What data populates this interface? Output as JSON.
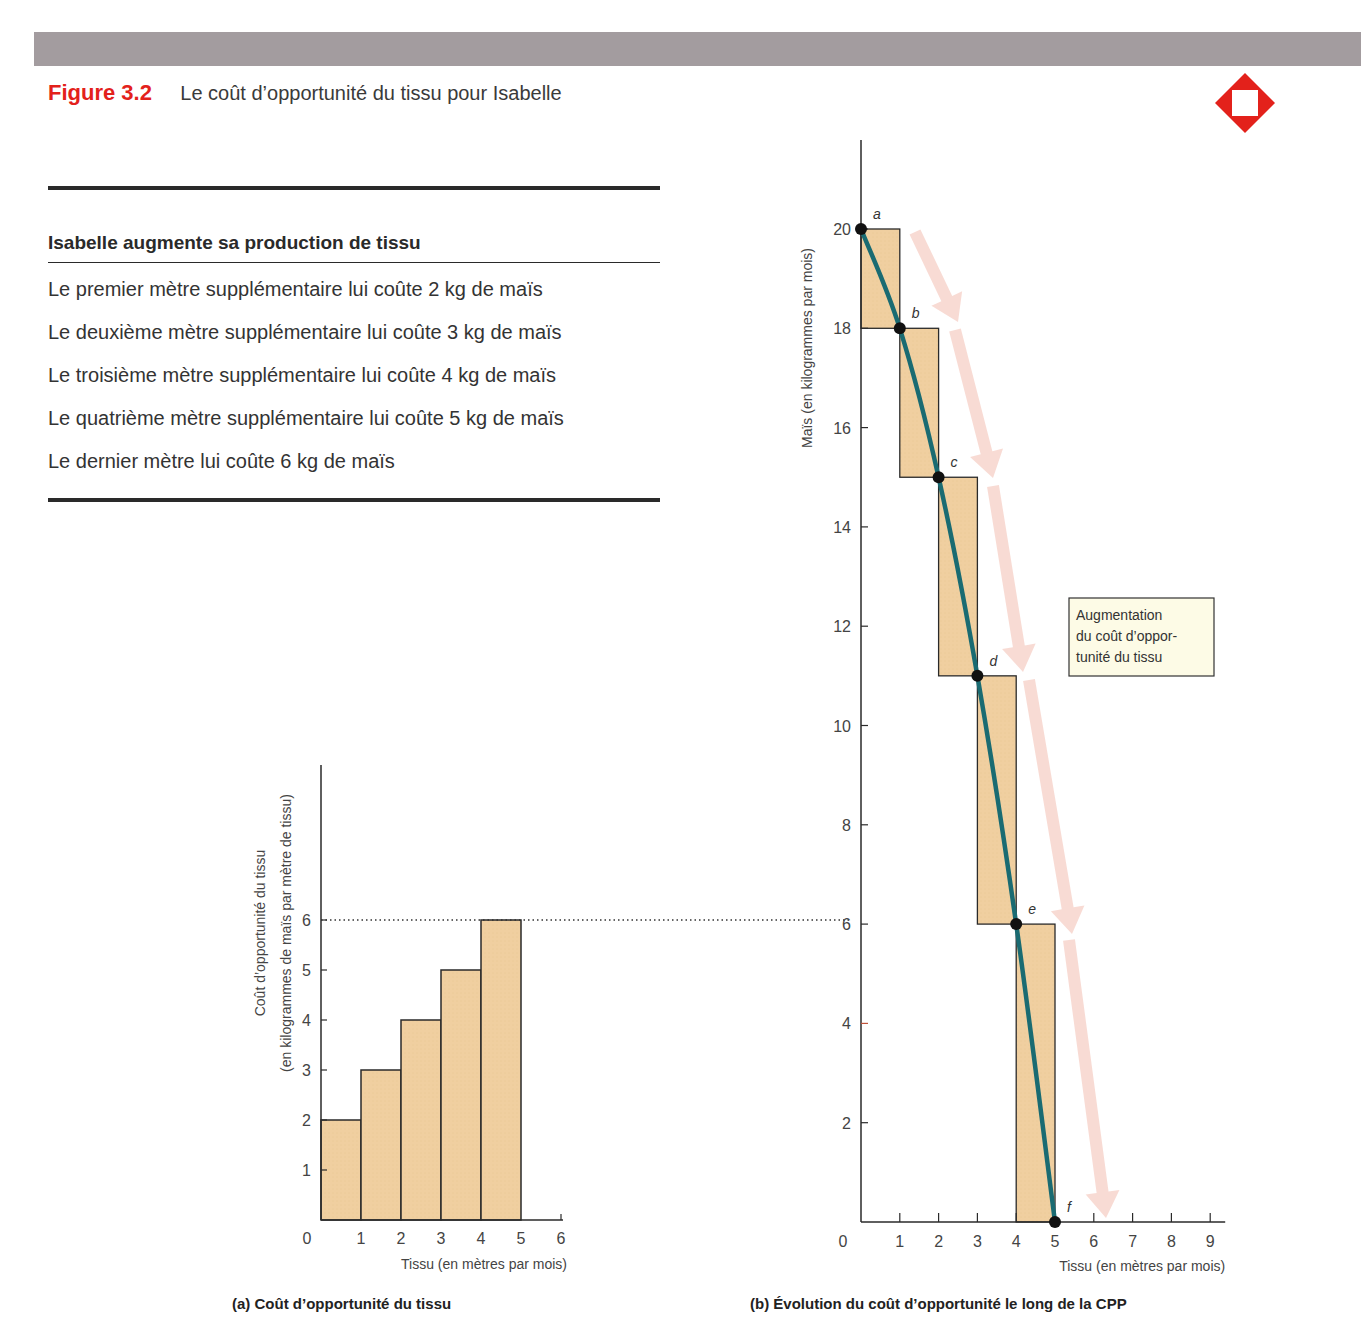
{
  "header": {
    "figure_number": "Figure 3.2",
    "figure_title": "Le coût d’opportunité du tissu pour Isabelle",
    "logo_icon": "red-diamond-logo-icon",
    "accent_color": "#e3211b",
    "bar_color": "#a39c9f"
  },
  "table": {
    "heading": "Isabelle augmente sa production de tissu",
    "rows": [
      "Le premier mètre supplémentaire lui coûte 2 kg de maïs",
      "Le deuxième mètre supplémentaire lui coûte 3 kg de maïs",
      "Le troisième mètre supplémentaire lui coûte 4 kg de maïs",
      "Le quatrième mètre supplémentaire lui coûte 5 kg de maïs",
      "Le dernier mètre lui coûte 6 kg de maïs"
    ]
  },
  "annotation": {
    "line1": "Augmentation",
    "line2": "du coût d’oppor-",
    "line3": "tunité du tissu"
  },
  "chart_data": [
    {
      "type": "bar",
      "title": "(a) Coût d’opportunité du tissu",
      "xlabel": "Tissu (en mètres par mois)",
      "ylabel": "Coût d’opportunité du tissu",
      "ylabel2": "(en kilogrammes de maïs par mètre de tissu)",
      "x_ticks": [
        "0",
        "1",
        "2",
        "3",
        "4",
        "5",
        "6"
      ],
      "y_ticks": [
        "1",
        "2",
        "3",
        "4",
        "5",
        "6"
      ],
      "categories": [
        "0–1",
        "1–2",
        "2–3",
        "3–4",
        "4–5"
      ],
      "values": [
        2,
        3,
        4,
        5,
        6
      ],
      "xlim": [
        0,
        6
      ],
      "ylim": [
        0,
        6
      ],
      "reference_line": {
        "y": 6,
        "style": "dotted"
      },
      "bar_fill": "#f0cfa0",
      "grid": false
    },
    {
      "type": "line",
      "title": "(b) Évolution du coût d’opportunité le long de la CPP",
      "xlabel": "Tissu (en mètres par mois)",
      "ylabel": "Maïs (en kilogrammes par mois)",
      "x_ticks": [
        "0",
        "1",
        "2",
        "3",
        "4",
        "5",
        "6",
        "7",
        "8",
        "9"
      ],
      "y_ticks": [
        "2",
        "4",
        "6",
        "8",
        "10",
        "12",
        "14",
        "16",
        "18",
        "20"
      ],
      "xlim": [
        0,
        9
      ],
      "ylim": [
        0,
        20
      ],
      "series": [
        {
          "name": "CPP",
          "color": "#1a6b72",
          "points": [
            {
              "label": "a",
              "x": 0,
              "y": 20
            },
            {
              "label": "b",
              "x": 1,
              "y": 18
            },
            {
              "label": "c",
              "x": 2,
              "y": 15
            },
            {
              "label": "d",
              "x": 3,
              "y": 11
            },
            {
              "label": "e",
              "x": 4,
              "y": 6
            },
            {
              "label": "f",
              "x": 5,
              "y": 0
            }
          ]
        }
      ],
      "steps": [
        {
          "x0": 0,
          "x1": 1,
          "y_top": 20,
          "y_bottom": 18,
          "cost": 2
        },
        {
          "x0": 1,
          "x1": 2,
          "y_top": 18,
          "y_bottom": 15,
          "cost": 3
        },
        {
          "x0": 2,
          "x1": 3,
          "y_top": 15,
          "y_bottom": 11,
          "cost": 4
        },
        {
          "x0": 3,
          "x1": 4,
          "y_top": 11,
          "y_bottom": 6,
          "cost": 5
        },
        {
          "x0": 4,
          "x1": 5,
          "y_top": 6,
          "y_bottom": 0,
          "cost": 6
        }
      ],
      "annotation": "Augmentation du coût d’opportunité du tissu",
      "grid": false
    }
  ]
}
